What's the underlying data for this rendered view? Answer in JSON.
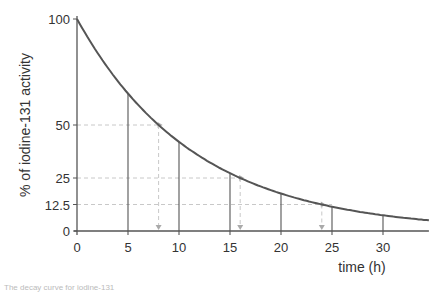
{
  "chart_data": {
    "type": "line",
    "title": "",
    "xlabel": "time (h)",
    "ylabel": "% of iodine-131 activity",
    "xlim": [
      0,
      34.5
    ],
    "ylim": [
      0,
      100
    ],
    "x_ticks": [
      0,
      5,
      10,
      15,
      20,
      25,
      30
    ],
    "y_ticks": [
      0,
      12.5,
      25,
      50,
      100
    ],
    "y_tick_labels": [
      "0",
      "12.5",
      "25",
      "50",
      "100"
    ],
    "grid": false,
    "half_life": 8,
    "series": [
      {
        "name": "iodine-131 decay curve",
        "x": [
          0,
          5,
          8,
          10,
          15,
          16,
          20,
          24,
          25,
          30,
          34.5
        ],
        "values": [
          100,
          64.8,
          50,
          42.0,
          27.3,
          25,
          17.7,
          12.5,
          11.5,
          7.4,
          5.0
        ]
      }
    ],
    "vertical_lines_at": [
      5,
      10,
      15,
      20,
      25,
      30
    ],
    "half_life_guides": [
      {
        "x": 8,
        "y": 50
      },
      {
        "x": 16,
        "y": 25
      },
      {
        "x": 24,
        "y": 12.5
      }
    ],
    "annotations": []
  },
  "caption": "The decay curve for iodine-131"
}
